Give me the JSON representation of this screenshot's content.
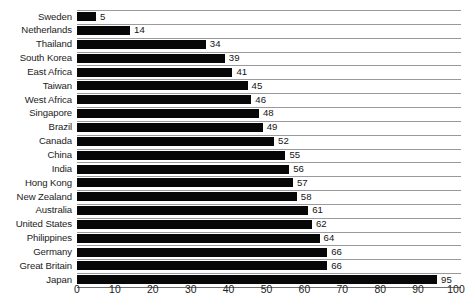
{
  "chart_data": {
    "type": "bar",
    "orientation": "horizontal",
    "title": "",
    "subtitle": "",
    "xlabel": "",
    "ylabel": "",
    "xlim": [
      0,
      100
    ],
    "xticks": [
      0,
      10,
      20,
      30,
      40,
      50,
      60,
      70,
      80,
      90,
      100
    ],
    "grid": true,
    "legend": false,
    "bar_color": "#070707",
    "gridline_color": "#9a9a9e",
    "axis_color": "#6e6e72",
    "background": "#ffffff",
    "show_value_labels": true,
    "categories": [
      "Sweden",
      "Netherlands",
      "Thailand",
      "South Korea",
      "East Africa",
      "Taiwan",
      "West Africa",
      "Singapore",
      "Brazil",
      "Canada",
      "China",
      "India",
      "Hong Kong",
      "New Zealand",
      "Australia",
      "United States",
      "Philippines",
      "Germany",
      "Great Britain",
      "Japan"
    ],
    "values": [
      5,
      14,
      34,
      39,
      41,
      45,
      46,
      48,
      49,
      52,
      55,
      56,
      57,
      58,
      61,
      62,
      64,
      66,
      66,
      95
    ],
    "rows": [
      {
        "label": "Sweden",
        "value": 5,
        "value_text": "5"
      },
      {
        "label": "Netherlands",
        "value": 14,
        "value_text": "14"
      },
      {
        "label": "Thailand",
        "value": 34,
        "value_text": "34"
      },
      {
        "label": "South Korea",
        "value": 39,
        "value_text": "39"
      },
      {
        "label": "East Africa",
        "value": 41,
        "value_text": "41"
      },
      {
        "label": "Taiwan",
        "value": 45,
        "value_text": "45"
      },
      {
        "label": "West Africa",
        "value": 46,
        "value_text": "46"
      },
      {
        "label": "Singapore",
        "value": 48,
        "value_text": "48"
      },
      {
        "label": "Brazil",
        "value": 49,
        "value_text": "49"
      },
      {
        "label": "Canada",
        "value": 52,
        "value_text": "52"
      },
      {
        "label": "China",
        "value": 55,
        "value_text": "55"
      },
      {
        "label": "India",
        "value": 56,
        "value_text": "56"
      },
      {
        "label": "Hong Kong",
        "value": 57,
        "value_text": "57"
      },
      {
        "label": "New Zealand",
        "value": 58,
        "value_text": "58"
      },
      {
        "label": "Australia",
        "value": 61,
        "value_text": "61"
      },
      {
        "label": "United States",
        "value": 62,
        "value_text": "62"
      },
      {
        "label": "Philippines",
        "value": 64,
        "value_text": "64"
      },
      {
        "label": "Germany",
        "value": 66,
        "value_text": "66"
      },
      {
        "label": "Great Britain",
        "value": 66,
        "value_text": "66"
      },
      {
        "label": "Japan",
        "value": 95,
        "value_text": "95"
      }
    ],
    "xtick_labels": [
      "0",
      "10",
      "20",
      "30",
      "40",
      "50",
      "60",
      "70",
      "80",
      "90",
      "100"
    ]
  }
}
